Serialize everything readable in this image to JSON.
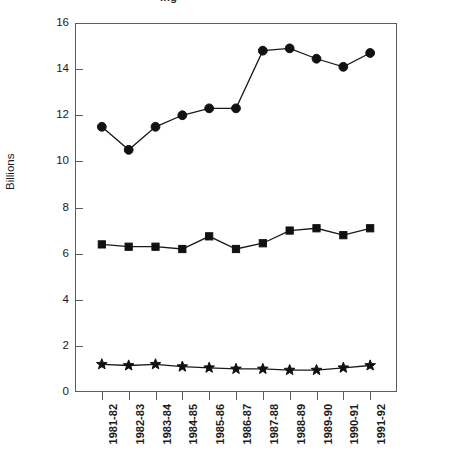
{
  "chart_data": {
    "type": "line",
    "title": "",
    "title_fragment": "ing",
    "xlabel": "",
    "ylabel": "Billions",
    "ylim": [
      0,
      16
    ],
    "yticks": [
      0,
      2,
      4,
      6,
      8,
      10,
      12,
      14,
      16
    ],
    "ytick_labels": [
      "0",
      "2",
      "4",
      "6",
      "8",
      "10",
      "12",
      "14",
      "16"
    ],
    "grid": false,
    "legend": "none",
    "categories": [
      "1981-82",
      "1982-83",
      "1983-84",
      "1984-85",
      "1985-86",
      "1986-87",
      "1987-88",
      "1988-89",
      "1989-90",
      "1990-91",
      "1991-92"
    ],
    "series": [
      {
        "name": "Series 1",
        "marker": "circle",
        "values": [
          11.5,
          10.5,
          11.5,
          12.0,
          12.3,
          12.3,
          14.8,
          14.9,
          14.45,
          14.1,
          14.7
        ]
      },
      {
        "name": "Series 2",
        "marker": "square",
        "values": [
          6.4,
          6.3,
          6.3,
          6.2,
          6.75,
          6.2,
          6.45,
          7.0,
          7.1,
          6.8,
          7.1
        ]
      },
      {
        "name": "Series 3",
        "marker": "star",
        "values": [
          1.2,
          1.15,
          1.2,
          1.1,
          1.05,
          1.0,
          1.0,
          0.95,
          0.95,
          1.05,
          1.15
        ]
      }
    ]
  }
}
